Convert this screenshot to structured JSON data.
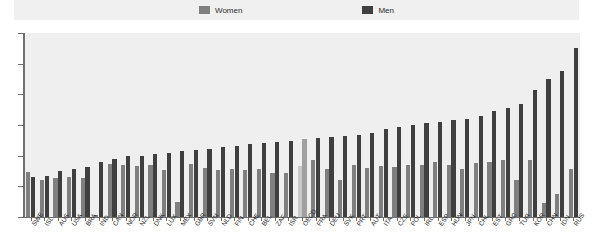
{
  "legend": {
    "items": [
      {
        "label": "Women",
        "color": "#7f7f7f",
        "icon": "square-swatch-icon"
      },
      {
        "label": "Men",
        "color": "#3f3f3f",
        "icon": "square-swatch-icon"
      }
    ]
  },
  "axis": {
    "y_ticks": [
      "0",
      "10",
      "20",
      "30",
      "40",
      "50",
      "60"
    ]
  },
  "colors": {
    "women": "#7f7f7f",
    "men": "#3f3f3f",
    "women_highlight": "#c8c8c8",
    "men_highlight": "#a0a0a0",
    "plot_background": "#efefef",
    "legend_background": "#f0f0f0",
    "axis": "#6e6e6e"
  },
  "chart_data": {
    "type": "bar",
    "title": "",
    "subtitle": "",
    "xlabel": "",
    "ylabel": "",
    "ylim": [
      0,
      60
    ],
    "grid": false,
    "legend_position": "top",
    "highlight_category": "OECD",
    "categories": [
      "SWE",
      "ISL",
      "AUS",
      "USA",
      "BRA",
      "IND",
      "CAN",
      "NOR",
      "NZL",
      "DNK",
      "LUX",
      "MEX",
      "GBR",
      "SVN",
      "NLD",
      "FIN",
      "CHE",
      "BEL",
      "ZAF",
      "ISR",
      "OECD",
      "FRA",
      "DEU",
      "SVK",
      "PRT",
      "AUT",
      "ITA",
      "CZE",
      "POL",
      "IRL",
      "ESP",
      "HUN",
      "JPN",
      "CHL",
      "EST",
      "GRC",
      "TUR",
      "KOR",
      "CHN",
      "IDN",
      "RUS"
    ],
    "series": [
      {
        "name": "Women",
        "values": [
          14.8,
          12.2,
          12.8,
          13.0,
          12.6,
          0.8,
          17.2,
          17.0,
          16.5,
          16.8,
          15.2,
          5.0,
          17.2,
          16.0,
          15.2,
          15.8,
          15.2,
          15.8,
          14.5,
          14.2,
          16.5,
          18.5,
          15.8,
          12.0,
          17.0,
          16.0,
          16.5,
          16.2,
          17.0,
          16.8,
          17.8,
          17.0,
          15.5,
          17.5,
          17.8,
          18.5,
          12.0,
          18.5,
          4.5,
          7.5,
          15.8
        ]
      },
      {
        "name": "Men",
        "values": [
          13.0,
          13.5,
          15.0,
          15.8,
          16.2,
          17.8,
          18.8,
          19.8,
          20.0,
          20.5,
          20.8,
          21.5,
          21.8,
          22.2,
          22.8,
          23.2,
          23.8,
          24.2,
          24.5,
          24.8,
          25.5,
          25.8,
          26.2,
          26.5,
          26.8,
          27.5,
          28.8,
          29.5,
          30.0,
          30.5,
          31.0,
          31.5,
          32.0,
          33.0,
          34.5,
          35.5,
          37.0,
          41.5,
          45.0,
          47.5,
          55.2
        ]
      }
    ]
  }
}
